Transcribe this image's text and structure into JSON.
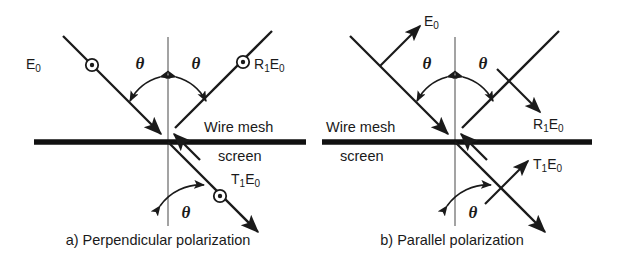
{
  "figure": {
    "background_color": "#ffffff",
    "ink_color": "#1a1a1a",
    "normal_line_color": "#666666",
    "screen_line_color": "#111111"
  },
  "panels": [
    {
      "id": "a",
      "caption": "a) Perpendicular polarization",
      "screen_label_line1": "Wire mesh",
      "screen_label_line2": "screen",
      "screen_label_side": "right",
      "polarization_marker": "circle-dot",
      "rays": [
        {
          "name": "incident",
          "label_main": "E",
          "label_sub": "0",
          "label_text": "E0",
          "direction": "down-right",
          "marker": "circle-dot"
        },
        {
          "name": "reflected",
          "label_main": "R",
          "label_sub1": "1",
          "label_main2": "E",
          "label_sub2": "0",
          "label_text": "R1E0",
          "direction": "up-right",
          "marker": "circle-dot"
        },
        {
          "name": "transmitted",
          "label_main": "T",
          "label_sub1": "1",
          "label_main2": "E",
          "label_sub2": "0",
          "label_text": "T1E0",
          "direction": "down-right",
          "marker": "circle-dot"
        }
      ],
      "angles": [
        {
          "name": "incidence-angle",
          "symbol": "θ"
        },
        {
          "name": "reflection-angle",
          "symbol": "θ"
        },
        {
          "name": "transmission-angle",
          "symbol": "θ"
        }
      ]
    },
    {
      "id": "b",
      "caption": "b) Parallel polarization",
      "screen_label_line1": "Wire mesh",
      "screen_label_line2": "screen",
      "screen_label_side": "left",
      "polarization_marker": "in-plane-arrow",
      "rays": [
        {
          "name": "incident",
          "label_main": "E",
          "label_sub": "0",
          "label_text": "E0",
          "direction": "down-right",
          "marker": "in-plane-arrow"
        },
        {
          "name": "reflected",
          "label_main": "R",
          "label_sub1": "1",
          "label_main2": "E",
          "label_sub2": "0",
          "label_text": "R1E0",
          "direction": "up-right",
          "marker": "in-plane-arrow"
        },
        {
          "name": "transmitted",
          "label_main": "T",
          "label_sub1": "1",
          "label_main2": "E",
          "label_sub2": "0",
          "label_text": "T1E0",
          "direction": "down-right",
          "marker": "in-plane-arrow"
        }
      ],
      "angles": [
        {
          "name": "incidence-angle",
          "symbol": "θ"
        },
        {
          "name": "reflection-angle",
          "symbol": "θ"
        },
        {
          "name": "transmission-angle",
          "symbol": "θ"
        }
      ]
    }
  ],
  "labels": {
    "E": "E",
    "R": "R",
    "T": "T",
    "zero": "0",
    "one": "1",
    "theta": "θ"
  }
}
